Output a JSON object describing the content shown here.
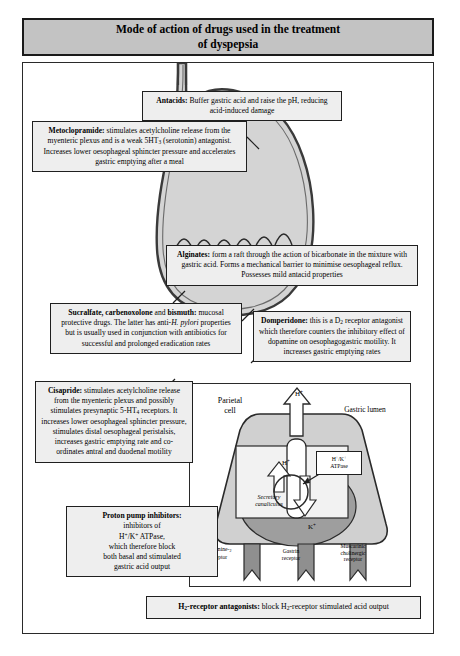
{
  "title": {
    "line1": "Mode of action of drugs used in the treatment",
    "line2": "of dyspepsia"
  },
  "colors": {
    "header_fill": "#c3c3c3",
    "box_fill": "#eeeeee",
    "stomach_fill": "#d4d4d4",
    "cell_fill": "#d0d0d0",
    "canaliculus_fill": "#9e9e9e",
    "border": "#1f1f1f"
  },
  "callouts": [
    {
      "id": "antacids",
      "drug": "Antacids:",
      "text": " Buffer gastric acid and raise the pH, reducing acid-induced damage"
    },
    {
      "id": "metoclopramide",
      "drug": "Metoclopramide:",
      "text": " stimulates acetylcholine release from the myenteric plexus and is a weak 5HT3 (serotonin) antagonist. Increases lower oesophageal sphincter pressure and accelerates gastric emptying after a meal"
    },
    {
      "id": "alginates",
      "drug": "Alginates:",
      "text": " form a raft through the action of bicarbonate in the mixture with gastric acid. Forms a mechanical barrier to minimise oesophageal reflux. Possesses mild antacid properties"
    },
    {
      "id": "sucralfate",
      "drug": "Sucralfate, carbenoxolone and bismuth:",
      "text": " mucosal protective drugs. The latter has anti-H. pylori properties but is usually used in conjunction with antibiotics for successful and prolonged eradication rates"
    },
    {
      "id": "domperidone",
      "drug": "Domperidone:",
      "text": " this is a D2 receptor antagonist which therefore counters the inhibitory effect of dopamine on oesophagogastric motility. It increases gastric emptying rates"
    },
    {
      "id": "cisapride",
      "drug": "Cisapride:",
      "text": " stimulates acetylcholine release from the myenteric plexus and possibly stimulates presynaptic 5-HT4 receptors. It increases lower oesophageal sphincter pressure, stimulates distal oesophageal peristalsis, increases gastric emptying rate and co-ordinates antral and duodenal motility"
    },
    {
      "id": "proton-pump-inhibitors",
      "drug": "Proton pump inhibitors:",
      "text": " inhibitors of H+/K+ ATPase, which therefore block both basal and stimulated gastric acid output"
    },
    {
      "id": "h2-receptor-antagonists",
      "drug": "H2-receptor antagonists:",
      "text": " block H2-receptor stimulated acid output"
    }
  ],
  "parietal_cell": {
    "cell_label_line1": "Parietal",
    "cell_label_line2": "cell",
    "lumen_label": "Gastric  lumen",
    "ion_h_outside": "H",
    "ion_h_inside": "H",
    "ion_k": "K",
    "atpase_line1": "H+/K+",
    "atpase_line2": "ATPase",
    "canaliculus_line1": "Secretory",
    "canaliculus_line2": "canaliculus",
    "receptors": [
      {
        "line1": "Histamine-2",
        "line2": "receptor"
      },
      {
        "line1": "Gastrin",
        "line2": "receptor"
      },
      {
        "line1": "Muscarinic",
        "line2": "cholinergic",
        "line3": "receptor"
      }
    ]
  }
}
